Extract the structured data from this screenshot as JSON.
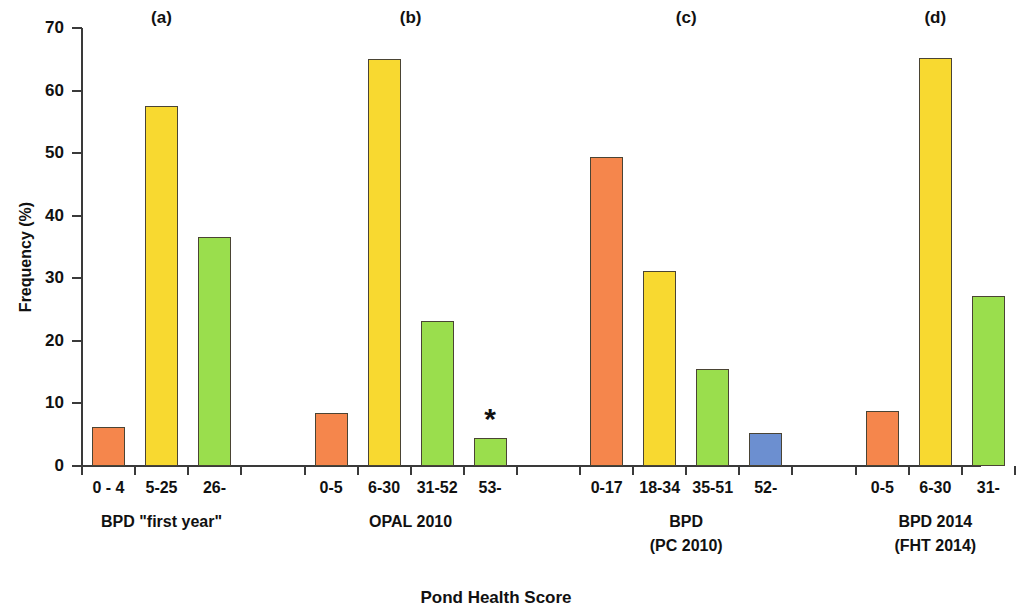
{
  "chart_data": {
    "type": "bar",
    "title": "",
    "xlabel": "Pond Health Score",
    "ylabel": "Frequency (%)",
    "ylim": [
      0,
      70
    ],
    "yticks": [
      0,
      10,
      20,
      30,
      40,
      50,
      60,
      70
    ],
    "grid": false,
    "legend": "none",
    "panels": [
      {
        "letter": "(a)",
        "group_label_lines": [
          "BPD \"first year\""
        ],
        "categories": [
          "0 - 4",
          "5-25",
          "26-"
        ],
        "values": [
          6.3,
          57.5,
          36.6
        ],
        "colors": [
          "#F5864C",
          "#F8D930",
          "#9ADE4D"
        ],
        "annotations": [
          "",
          "",
          ""
        ]
      },
      {
        "letter": "(b)",
        "group_label_lines": [
          "OPAL 2010"
        ],
        "categories": [
          "0-5",
          "6-30",
          "31-52",
          "53-"
        ],
        "values": [
          8.5,
          65.0,
          23.1,
          4.4
        ],
        "colors": [
          "#F5864C",
          "#F8D930",
          "#9ADE4D",
          "#9ADE4D"
        ],
        "annotations": [
          "",
          "",
          "",
          "*"
        ]
      },
      {
        "letter": "(c)",
        "group_label_lines": [
          "BPD",
          "(PC 2010)"
        ],
        "categories": [
          "0-17",
          "18-34",
          "35-51",
          "52-"
        ],
        "values": [
          49.4,
          31.1,
          15.5,
          5.2
        ],
        "colors": [
          "#F5864C",
          "#F8D930",
          "#9ADE4D",
          "#6C8FD0"
        ],
        "annotations": [
          "",
          "",
          "",
          ""
        ]
      },
      {
        "letter": "(d)",
        "group_label_lines": [
          "BPD 2014",
          "(FHT 2014)"
        ],
        "categories": [
          "0-5",
          "6-30",
          "31-"
        ],
        "values": [
          8.8,
          65.2,
          27.1
        ],
        "colors": [
          "#F5864C",
          "#F8D930",
          "#9ADE4D"
        ],
        "annotations": [
          "",
          "",
          ""
        ]
      }
    ]
  },
  "colors": {
    "orange": "#F5864C",
    "yellow": "#F8D930",
    "green": "#9ADE4D",
    "blue": "#6C8FD0",
    "axis": "#3a3a3a",
    "bar_outline": "#4a4434"
  },
  "axis": {
    "x_title": "Pond Health Score",
    "y_title": "Frequency (%)"
  }
}
